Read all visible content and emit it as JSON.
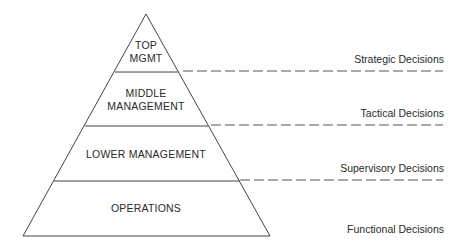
{
  "diagram": {
    "type": "management-pyramid",
    "tiers": [
      {
        "label_line1": "TOP",
        "label_line2": "MGMT"
      },
      {
        "label_line1": "MIDDLE",
        "label_line2": "MANAGEMENT"
      },
      {
        "label_line1": "LOWER MANAGEMENT"
      },
      {
        "label_line1": "OPERATIONS"
      }
    ],
    "decisions": [
      {
        "label": "Strategic Decisions"
      },
      {
        "label": "Tactical Decisions"
      },
      {
        "label": "Supervisory Decisions"
      },
      {
        "label": "Functional Decisions"
      }
    ],
    "colors": {
      "line": "#444444",
      "dash": "#555555",
      "text": "#2a2a2a",
      "background": "#ffffff"
    }
  }
}
